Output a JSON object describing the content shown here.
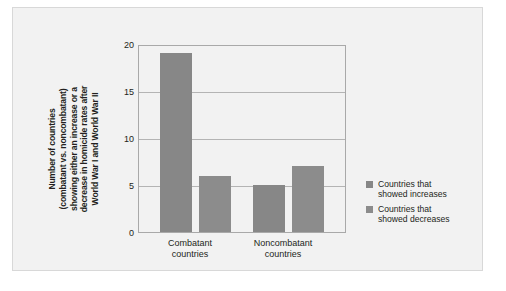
{
  "chart_data": {
    "type": "bar",
    "title": "",
    "xlabel": "",
    "ylabel_lines": [
      "Number of countries",
      "(combatant vs. noncombatant)",
      "showing either an increase or a",
      "decrease in homicide rates after",
      "World War I and World War II"
    ],
    "categories": [
      "Combatant countries",
      "Noncombatant countries"
    ],
    "category_lines": [
      [
        "Combatant",
        "countries"
      ],
      [
        "Noncombatant",
        "countries"
      ]
    ],
    "series": [
      {
        "name": "Countries that showed increases",
        "values": [
          19,
          5
        ],
        "color": "#878787"
      },
      {
        "name": "Countries that showed decreases",
        "values": [
          6,
          7
        ],
        "color": "#8c8c8c"
      }
    ],
    "ylim": [
      0,
      20
    ],
    "yticks": [
      0,
      5,
      10,
      15,
      20
    ],
    "ytick_labels": [
      "0",
      "5",
      "10",
      "15",
      "20"
    ],
    "grid": true,
    "legend_position": "right",
    "legend_entries": [
      {
        "label_lines": [
          "Countries that",
          "showed increases"
        ],
        "color": "#878787"
      },
      {
        "label_lines": [
          "Countries that",
          "showed decreases"
        ],
        "color": "#8c8c8c"
      }
    ]
  },
  "colors": {
    "card_background": "#f2f2f2",
    "card_border": "#d8d8d8",
    "axis": "#a9a9a9",
    "gridline": "#b4b4b4",
    "text": "#231f20"
  }
}
